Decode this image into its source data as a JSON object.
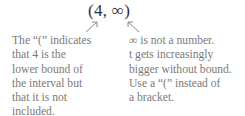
{
  "interval": "(4, ∞)",
  "left_note": {
    "lines": [
      "The “(” indicates",
      "that 4 is the",
      "lower bound of",
      "the interval but",
      "that it is not",
      "included."
    ]
  },
  "right_note": {
    "lines": [
      "∞ is not a number.",
      "t gets increasingly",
      "bigger without bound.",
      "Use a “(” instead of",
      "a bracket."
    ]
  },
  "colors": {
    "text": "#7a7a7a",
    "interval": "#333333",
    "arrow": "#888888"
  }
}
